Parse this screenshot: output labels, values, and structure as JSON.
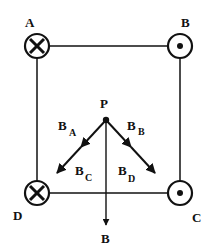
{
  "diagram": {
    "type": "magnetic field of four wires",
    "colors": {
      "ink": "#111111",
      "background": "#ffffff"
    },
    "wires": [
      {
        "label": "A",
        "direction": "into-page",
        "symbol": "cross"
      },
      {
        "label": "B",
        "direction": "out-of-page",
        "symbol": "dot"
      },
      {
        "label": "C",
        "direction": "out-of-page",
        "symbol": "dot"
      },
      {
        "label": "D",
        "direction": "into-page",
        "symbol": "cross"
      }
    ],
    "point": {
      "label": "P"
    },
    "vectors": [
      {
        "main": "B",
        "sub": "A"
      },
      {
        "main": "B",
        "sub": "B"
      },
      {
        "main": "B",
        "sub": "C"
      },
      {
        "main": "B",
        "sub": "D"
      }
    ],
    "resultant": {
      "label": "B"
    }
  }
}
